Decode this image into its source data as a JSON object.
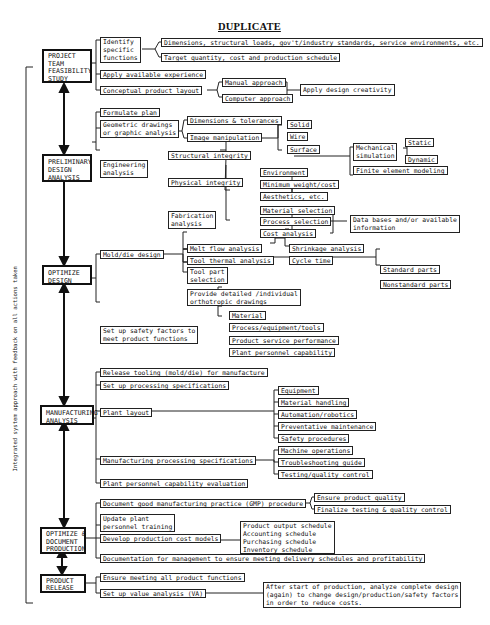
{
  "title": "DUPLICATE",
  "side_label": "Integrated system approach with feedback on all actions taken",
  "stages": [
    {
      "id": "project",
      "label": "PROJECT\nTEAM\nFEASIBILITY\nSTUDY"
    },
    {
      "id": "preliminary",
      "label": "PRELIMINARY\nDESIGN\nANALYSIS"
    },
    {
      "id": "optimize",
      "label": "OPTIMIZE\nDESIGN"
    },
    {
      "id": "manufacturing",
      "label": "MANUFACTURING\nANALYSIS"
    },
    {
      "id": "optimize_doc",
      "label": "OPTIMIZE &\nDOCUMENT\nPRODUCTION"
    },
    {
      "id": "release",
      "label": "PRODUCT\nRELEASE"
    }
  ],
  "project": {
    "identify": "Identify\nspecific\nfunctions",
    "dimensions": "Dimensions, structural loads, gov't/industry standards, service environments, etc.",
    "target": "Target quantity, cost and production schedule",
    "apply_experience": "Apply available experience",
    "conceptual": "Conceptual product layout",
    "manual": "Manual approach",
    "computer": "Computer approach",
    "creativity": "Apply design creativity"
  },
  "preliminary": {
    "formulate": "Formulate plan",
    "geometric": "Geometric drawings\nor graphic analysis",
    "dimensions_tol": "Dimensions & tolerances",
    "image_manip": "Image manipulation",
    "solid": "Solid",
    "wire": "Wire",
    "surface": "Surface",
    "engineering": "Engineering\nanalysis",
    "structural": "Structural integrity",
    "mechanical_sim": "Mechanical\nsimulation",
    "static": "Static",
    "dynamic": "Dynamic",
    "fem": "Finite element modeling",
    "physical": "Physical integrity",
    "environment": "Environment",
    "min_weight": "Minimum weight/cost",
    "aesthetics": "Aesthetics, etc.",
    "fabrication": "Fabrication\nanalysis",
    "material_sel": "Material selection",
    "process_sel": "Process selection",
    "cost_analysis": "Cost analysis",
    "databases": "Data bases and/or available\ninformation"
  },
  "optimize": {
    "mold_die": "Mold/die design",
    "melt_flow": "Melt flow analysis",
    "tool_thermal": "Tool thermal analysis",
    "shrinkage": "Shrinkage analysis",
    "cycle_time": "Cycle time",
    "tool_part": "Tool part\nselection",
    "standard_parts": "Standard parts",
    "nonstandard_parts": "Nonstandard parts",
    "detailed_drawings": "Provide detailed /individual\northotropic drawings",
    "safety_factors": "Set up safety factors to\nmeet product functions",
    "material": "Material",
    "process_equip": "Process/equipment/tools",
    "service_perf": "Product service performance",
    "personnel_cap": "Plant personnel capability"
  },
  "manufacturing": {
    "release_tooling": "Release tooling (mold/die) for manufacture",
    "processing_specs": "Set up processing specifications",
    "plant_layout": "Plant layout",
    "equipment": "Equipment",
    "material_handling": "Material handling",
    "automation": "Automation/robotics",
    "preventative": "Preventative maintenance",
    "safety": "Safety procedures",
    "mfg_specs": "Manufacturing processing specifications",
    "machine_ops": "Machine operations",
    "troubleshooting": "Troubleshooting guide",
    "testing_qc": "Testing/quality control",
    "personnel_eval": "Plant personnel capability evaluation"
  },
  "optimize_doc": {
    "gmp": "Document good manufacturing practice (GMP) procedure",
    "ensure_quality": "Ensure product quality",
    "finalize_testing": "Finalize testing & quality control",
    "update_training": "Update plant\npersonnel training",
    "cost_models": "Develop production cost models",
    "schedules": "Product output schedule\nAccounting schedule\nPurchasing schedule\nInventory schedule",
    "documentation": "Documentation for management to ensure meeting delivery schedules and profitability"
  },
  "release": {
    "ensure_functions": "Ensure meeting all product functions",
    "value_analysis": "Set up value analysis (VA)",
    "after_start": "After start of production, analyze complete design\n(again) to change design/production/safety factors\nin order to reduce costs."
  }
}
